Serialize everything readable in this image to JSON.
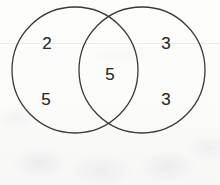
{
  "diagram": {
    "type": "venn-two-set",
    "background_color": "#fbfbfa",
    "stroke_color": "#3a3a3a",
    "stroke_width": 1.3,
    "text_color": "#2b2b2b",
    "circles": [
      {
        "name": "left-circle",
        "cx": 75,
        "cy": 70,
        "r": 63
      },
      {
        "name": "right-circle",
        "cx": 142,
        "cy": 70,
        "r": 63
      }
    ],
    "labels": [
      {
        "id": "left-upper",
        "region": "left-only",
        "value": "2",
        "x": 47,
        "y": 43
      },
      {
        "id": "left-lower",
        "region": "left-only",
        "value": "5",
        "x": 46,
        "y": 99
      },
      {
        "id": "center",
        "region": "intersection",
        "value": "5",
        "x": 110,
        "y": 74
      },
      {
        "id": "right-upper",
        "region": "right-only",
        "value": "3",
        "x": 166,
        "y": 43
      },
      {
        "id": "right-lower",
        "region": "right-only",
        "value": "3",
        "x": 166,
        "y": 99
      }
    ]
  },
  "chart_data": {
    "type": "venn",
    "sets": [
      "left-circle",
      "right-circle"
    ],
    "regions": [
      {
        "region": "left-only",
        "labels": [
          "2",
          "5"
        ]
      },
      {
        "region": "intersection",
        "labels": [
          "5"
        ]
      },
      {
        "region": "right-only",
        "labels": [
          "3",
          "3"
        ]
      }
    ],
    "values": {
      "left_only_upper": 2,
      "left_only_lower": 5,
      "intersection": 5,
      "right_only_upper": 3,
      "right_only_lower": 3
    }
  }
}
